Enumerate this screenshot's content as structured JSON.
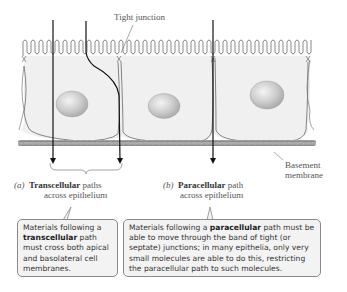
{
  "diagram": {
    "labels": {
      "tight_junction": "Tight junction",
      "basement_membrane_line1": "Basement",
      "basement_membrane_line2": "membrane",
      "transcellular": {
        "marker": "(a)",
        "bold": "Transcellular",
        "rest": " paths",
        "line2": "across epithelium"
      },
      "paracellular": {
        "marker": "(b)",
        "bold": "Paracellular",
        "rest": " path",
        "line2": "across epithelium"
      }
    },
    "callouts": {
      "transcellular": {
        "prefix": "Materials following a",
        "bold": "transcellular",
        "suffix": " path must cross both apical and basolateral cell membranes."
      },
      "paracellular": {
        "prefix": "Materials following a ",
        "bold": "paracellular",
        "suffix": " path must be able to move through the band of tight (or septate) junctions; in many epithelia, only very small molecules are able to do this, restricting the paracellular path to such molecules."
      }
    },
    "colors": {
      "cell_fill": "#f0f0f0",
      "outline": "#555555",
      "path_line": "#111111",
      "basement": "#9a9a9a",
      "callout_fill": "#f3f3f3"
    }
  }
}
